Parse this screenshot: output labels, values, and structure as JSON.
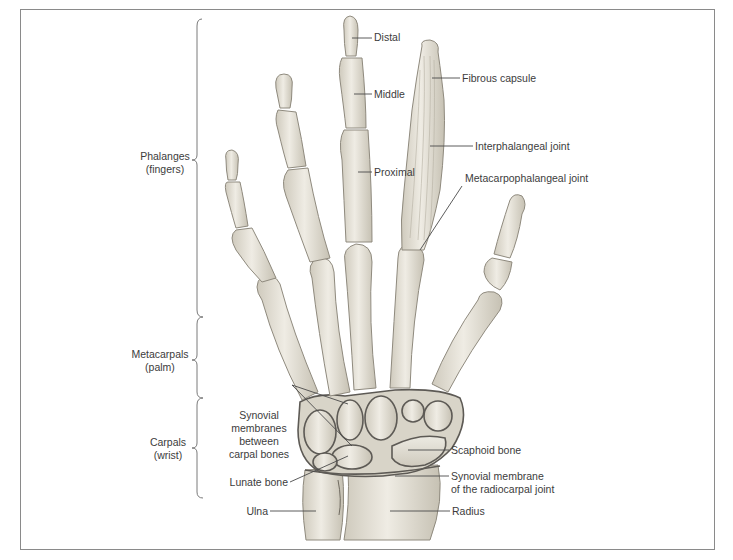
{
  "figure": {
    "groups": [
      {
        "id": "phalanges",
        "line1": "Phalanges",
        "line2": "(fingers)"
      },
      {
        "id": "metacarpals",
        "line1": "Metacarpals",
        "line2": "(palm)"
      },
      {
        "id": "carpals",
        "line1": "Carpals",
        "line2": "(wrist)"
      }
    ],
    "labels": {
      "distal": "Distal",
      "middle": "Middle",
      "proximal": "Proximal",
      "fibrous_capsule": "Fibrous capsule",
      "interphalangeal_joint": "Interphalangeal joint",
      "metacarpophalangeal_joint": "Metacarpophalangeal joint",
      "synovial_membranes": [
        "Synovial",
        "membranes",
        "between",
        "carpal bones"
      ],
      "scaphoid_bone": "Scaphoid bone",
      "lunate_bone": "Lunate bone",
      "synovial_membrane_radiocarpal": [
        "Synovial membrane",
        "of the radiocarpal joint"
      ],
      "ulna": "Ulna",
      "radius": "Radius"
    },
    "colors": {
      "bone_fill": "#e9e6dc",
      "bone_shade": "#c9c4b6",
      "bone_outline": "#8f8a7e",
      "membrane": "#5d5a55",
      "leader_line": "#4a4a4a",
      "frame": "#8a8a8a"
    }
  }
}
